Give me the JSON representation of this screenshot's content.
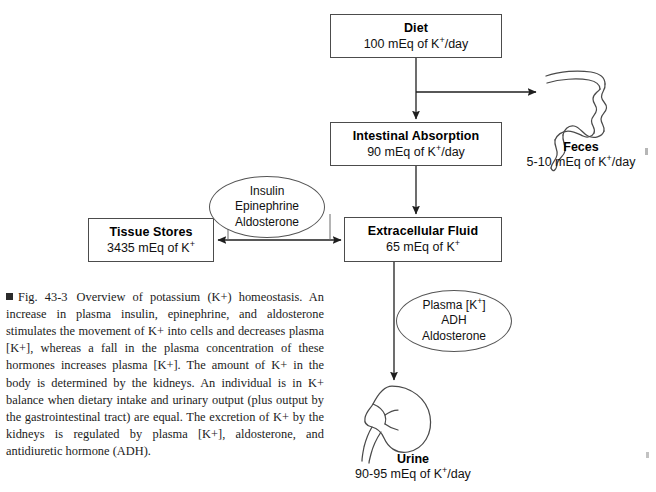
{
  "figure": {
    "number": "Fig. 43-3",
    "marker": "square-bullet",
    "caption": "Overview of potassium (K+) homeostasis. An increase in plasma insulin, epinephrine, and aldosterone stimulates the movement of K+ into cells and decreases plasma [K+], whereas a fall in the plasma concentration of these hormones increases plasma [K+]. The amount of K+ in the body is determined by the kidneys. An individual is in K+ balance when dietary intake and urinary output (plus output by the gastrointestinal tract) are equal. The excretion of K+ by the kidneys is regulated by plasma [K+], aldosterone, and antidiuretic hormone (ADH)."
  },
  "nodes": {
    "diet": {
      "title": "Diet",
      "value": "100 mEq of K",
      "sup": "+",
      "unit": "/day"
    },
    "intestinal_absorption": {
      "title": "Intestinal Absorption",
      "value": "90 mEq of K",
      "sup": "+",
      "unit": "/day"
    },
    "extracellular_fluid": {
      "title": "Extracellular Fluid",
      "value": "65 mEq of K",
      "sup": "+",
      "unit": ""
    },
    "tissue_stores": {
      "title": "Tissue Stores",
      "value": "3435 mEq of K",
      "sup": "+",
      "unit": ""
    }
  },
  "ellipses": {
    "hormones": {
      "line1": "Insulin",
      "line2": "Epinephrine",
      "line3": "Aldosterone"
    },
    "renal_regulators": {
      "line1_pre": "Plasma [K",
      "line1_sup": "+",
      "line1_post": "]",
      "line2": "ADH",
      "line3": "Aldosterone"
    }
  },
  "organs": {
    "feces": {
      "icon": "large-intestine-icon",
      "title": "Feces",
      "value": "5-10 mEq of K",
      "sup": "+",
      "unit": "/day"
    },
    "urine": {
      "icon": "kidney-icon",
      "title": "Urine",
      "value": "90-95 mEq of K",
      "sup": "+",
      "unit": "/day"
    }
  },
  "arrows": [
    {
      "name": "diet-to-intestinal-absorption",
      "type": "single"
    },
    {
      "name": "diet-to-feces",
      "type": "single"
    },
    {
      "name": "intestinal-absorption-to-extracellular-fluid",
      "type": "single"
    },
    {
      "name": "tissue-stores-extracellular-fluid",
      "type": "double"
    },
    {
      "name": "extracellular-fluid-to-urine",
      "type": "single"
    }
  ],
  "colors": {
    "stroke": "#4c4c4c",
    "text": "#111111",
    "background": "#ffffff"
  }
}
